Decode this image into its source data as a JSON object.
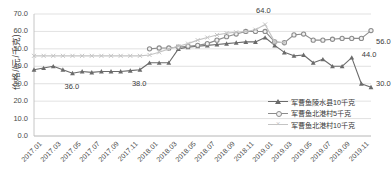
{
  "chart_data": {
    "type": "line",
    "title": "",
    "xlabel": "",
    "ylabel": "价格/(元/千克)",
    "ylim": [
      0.0,
      70.0
    ],
    "ytick_labels": [
      "0.0",
      "10.0",
      "20.0",
      "30.0",
      "40.0",
      "50.0",
      "60.0",
      "70.0"
    ],
    "ytick_values": [
      0.0,
      10.0,
      20.0,
      30.0,
      40.0,
      50.0,
      60.0,
      70.0
    ],
    "grid": true,
    "grid_axis": "y",
    "legend_position": "bottom-right",
    "x": [
      "2017.01",
      "2017.02",
      "2017.03",
      "2017.04",
      "2017.05",
      "2017.06",
      "2017.07",
      "2017.08",
      "2017.09",
      "2017.10",
      "2017.11",
      "2017.12",
      "2018.01",
      "2018.02",
      "2018.03",
      "2018.04",
      "2018.05",
      "2018.06",
      "2018.07",
      "2018.08",
      "2018.09",
      "2018.10",
      "2018.11",
      "2018.12",
      "2019.01",
      "2019.02",
      "2019.03",
      "2019.04",
      "2019.05",
      "2019.06",
      "2019.07",
      "2019.08",
      "2019.09",
      "2019.10",
      "2019.11",
      "2019.12"
    ],
    "xtick_labels": [
      "2017.01",
      "2017.03",
      "2017.05",
      "2017.07",
      "2017.09",
      "2017.11",
      "2018.01",
      "2018.03",
      "2018.05",
      "2018.07",
      "2018.09",
      "2018.11",
      "2019.01",
      "2019.03",
      "2019.05",
      "2019.07",
      "2019.09",
      "2019.11"
    ],
    "xtick_indices": [
      0,
      2,
      4,
      6,
      8,
      10,
      12,
      14,
      16,
      18,
      20,
      22,
      24,
      26,
      28,
      30,
      32,
      34
    ],
    "series": [
      {
        "name": "军曹鱼陵水县10千克",
        "color": "#6b6b6b",
        "marker": "triangle",
        "linestyle": "solid",
        "values": [
          38.0,
          39.0,
          40.0,
          38.0,
          36.0,
          37.0,
          36.5,
          37.0,
          37.0,
          37.0,
          37.5,
          38.0,
          42.0,
          42.0,
          42.0,
          50.0,
          51.0,
          51.5,
          52.0,
          52.5,
          53.0,
          53.5,
          54.0,
          54.0,
          56.5,
          52.0,
          48.0,
          46.0,
          46.5,
          42.0,
          44.0,
          40.0,
          40.0,
          45.0,
          30.0,
          28.0
        ]
      },
      {
        "name": "军曹鱼北港村5千克",
        "color": "#8c8c8c",
        "marker": "circle",
        "linestyle": "solid",
        "values": [
          null,
          null,
          null,
          null,
          null,
          null,
          null,
          null,
          null,
          null,
          null,
          null,
          50.0,
          50.5,
          50.5,
          51.0,
          51.5,
          52.0,
          53.0,
          55.0,
          57.0,
          58.5,
          60.0,
          60.0,
          60.0,
          54.0,
          53.5,
          58.0,
          58.5,
          55.0,
          55.0,
          55.5,
          56.0,
          56.0,
          56.0,
          60.5
        ]
      },
      {
        "name": "军曹鱼北港村10千克",
        "color": "#c4c4c4",
        "marker": "x",
        "linestyle": "solid",
        "values": [
          46.0,
          46.0,
          46.0,
          46.0,
          46.0,
          46.0,
          46.0,
          46.0,
          46.0,
          46.0,
          46.0,
          46.0,
          46.5,
          48.0,
          50.0,
          51.5,
          53.0,
          55.0,
          56.5,
          58.0,
          59.0,
          59.5,
          60.0,
          61.0,
          64.0,
          54.0,
          53.5,
          null,
          null,
          null,
          null,
          null,
          null,
          null,
          null,
          null
        ]
      }
    ],
    "annotations": [
      {
        "text": "36.0",
        "x_index": 4,
        "value": 36.0,
        "dx": -8,
        "dy": 14
      },
      {
        "text": "38.0",
        "x_index": 11,
        "value": 38.0,
        "dx": -8,
        "dy": 14
      },
      {
        "text": "64.0",
        "x_index": 24,
        "value": 64.0,
        "dx": -9,
        "dy": -13
      },
      {
        "text": "56.0",
        "x_index": 35,
        "value": 56.0,
        "dx": 5,
        "dy": 4
      },
      {
        "text": "44.0",
        "x_index": 33,
        "value": 44.0,
        "dx": 10,
        "dy": -4
      },
      {
        "text": "30.0",
        "x_index": 35,
        "value": 30.0,
        "dx": 5,
        "dy": 0
      }
    ]
  },
  "legend": {
    "items": [
      {
        "label": "军曹鱼陵水县10千克"
      },
      {
        "label": "军曹鱼北港村5千克"
      },
      {
        "label": "军曹鱼北港村10千克"
      }
    ]
  }
}
